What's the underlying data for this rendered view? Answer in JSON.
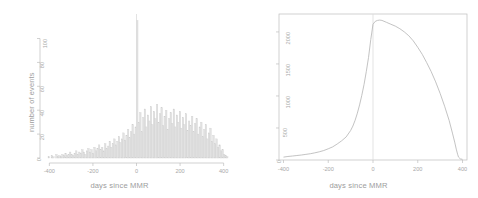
{
  "figure": {
    "panels": [
      {
        "id": "histogram-events",
        "xlabel": "days since MMR",
        "ylabel": "number of events"
      },
      {
        "id": "line-under-observation",
        "xlabel": "days since MMR",
        "ylabel": "number under observation"
      }
    ]
  },
  "chart_data": [
    {
      "type": "bar",
      "title": "",
      "xlabel": "days since MMR",
      "ylabel": "number of events",
      "xlim": [
        -420,
        420
      ],
      "ylim": [
        0,
        118
      ],
      "xticks": [
        -400,
        -200,
        0,
        200,
        400
      ],
      "yticks": [
        0,
        20,
        40,
        60,
        80,
        100
      ],
      "grid": false,
      "legend": null,
      "bin_width": 7,
      "annotations": [
        {
          "type": "vline",
          "x": 0,
          "label": "day of MMR vaccination"
        }
      ],
      "categories": [
        -420,
        -413,
        -406,
        -399,
        -392,
        -385,
        -378,
        -371,
        -364,
        -357,
        -350,
        -343,
        -336,
        -329,
        -322,
        -315,
        -308,
        -301,
        -294,
        -287,
        -280,
        -273,
        -266,
        -259,
        -252,
        -245,
        -238,
        -231,
        -224,
        -217,
        -210,
        -203,
        -196,
        -189,
        -182,
        -175,
        -168,
        -161,
        -154,
        -147,
        -140,
        -133,
        -126,
        -119,
        -112,
        -105,
        -98,
        -91,
        -84,
        -77,
        -70,
        -63,
        -56,
        -49,
        -42,
        -35,
        -28,
        -21,
        -14,
        -7,
        0,
        7,
        14,
        21,
        28,
        35,
        42,
        49,
        56,
        63,
        70,
        77,
        84,
        91,
        98,
        105,
        112,
        119,
        126,
        133,
        140,
        147,
        154,
        161,
        168,
        175,
        182,
        189,
        196,
        203,
        210,
        217,
        224,
        231,
        238,
        245,
        252,
        259,
        266,
        273,
        280,
        287,
        294,
        301,
        308,
        315,
        322,
        329,
        336,
        343,
        350,
        357,
        364,
        371,
        378,
        385,
        392,
        399,
        406,
        413
      ],
      "values": [
        0,
        0,
        1,
        0,
        2,
        1,
        0,
        3,
        1,
        2,
        1,
        3,
        2,
        4,
        2,
        3,
        5,
        3,
        2,
        4,
        6,
        3,
        5,
        4,
        7,
        5,
        3,
        6,
        8,
        5,
        7,
        4,
        9,
        6,
        8,
        11,
        7,
        9,
        6,
        12,
        8,
        10,
        14,
        9,
        12,
        16,
        11,
        14,
        18,
        13,
        16,
        21,
        15,
        19,
        24,
        17,
        22,
        28,
        20,
        26,
        115,
        30,
        38,
        22,
        34,
        41,
        26,
        36,
        31,
        43,
        28,
        39,
        33,
        45,
        30,
        37,
        42,
        27,
        35,
        40,
        24,
        33,
        38,
        29,
        41,
        26,
        36,
        30,
        39,
        25,
        34,
        28,
        37,
        23,
        31,
        27,
        35,
        22,
        29,
        33,
        20,
        26,
        30,
        18,
        24,
        28,
        16,
        21,
        25,
        14,
        19,
        12,
        16,
        9,
        11,
        6,
        7,
        3,
        2,
        1
      ]
    },
    {
      "type": "line",
      "title": "",
      "xlabel": "days since MMR",
      "ylabel": "number under observation",
      "xlim": [
        -420,
        420
      ],
      "ylim": [
        0,
        2280
      ],
      "xticks": [
        -400,
        -200,
        0,
        200,
        400
      ],
      "yticks": [
        0,
        500,
        1000,
        1500,
        2000
      ],
      "grid": false,
      "legend": null,
      "annotations": [
        {
          "type": "vline",
          "x": 0,
          "label": "day of MMR vaccination"
        }
      ],
      "x": [
        -400,
        -380,
        -360,
        -340,
        -320,
        -300,
        -280,
        -260,
        -240,
        -220,
        -200,
        -180,
        -160,
        -140,
        -120,
        -100,
        -90,
        -80,
        -70,
        -60,
        -50,
        -40,
        -30,
        -20,
        -10,
        0,
        10,
        20,
        30,
        40,
        60,
        80,
        100,
        120,
        140,
        160,
        180,
        200,
        220,
        240,
        260,
        280,
        300,
        320,
        340,
        355,
        365,
        372,
        378,
        382,
        390,
        400
      ],
      "y": [
        45,
        55,
        62,
        70,
        78,
        88,
        98,
        112,
        128,
        148,
        175,
        205,
        250,
        300,
        360,
        460,
        530,
        620,
        730,
        860,
        1010,
        1180,
        1380,
        1600,
        1880,
        2120,
        2165,
        2180,
        2185,
        2180,
        2150,
        2120,
        2090,
        2050,
        2000,
        1940,
        1860,
        1760,
        1650,
        1520,
        1380,
        1220,
        1040,
        840,
        620,
        420,
        280,
        170,
        90,
        45,
        18,
        10
      ]
    }
  ]
}
